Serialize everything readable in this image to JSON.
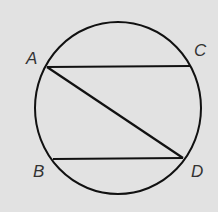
{
  "diagram": {
    "type": "circle with chords",
    "background": "#e2e2e2",
    "stroke": "#111111",
    "circle": {
      "cx": 118,
      "cy": 108,
      "rx": 83,
      "ry": 86
    },
    "points": [
      {
        "id": "A",
        "label": "A",
        "x": 47,
        "y": 67
      },
      {
        "id": "C",
        "label": "C",
        "x": 190,
        "y": 67
      },
      {
        "id": "B",
        "label": "B",
        "x": 53,
        "y": 159
      },
      {
        "id": "D",
        "label": "D",
        "x": 183,
        "y": 158
      }
    ],
    "chords": [
      [
        "A",
        "C"
      ],
      [
        "A",
        "D"
      ],
      [
        "B",
        "D"
      ]
    ]
  }
}
